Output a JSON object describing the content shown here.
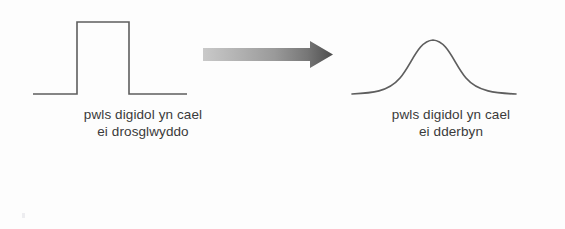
{
  "figure": {
    "name": "digital-pulse-transmission-diagram",
    "background_color": "#fdfdfd",
    "ink_color": "#595959",
    "text_color": "#3a3a3a"
  },
  "left_waveform": {
    "icon": "square-pulse-waveform",
    "description": "square pulse",
    "baseline_y": 94,
    "pulse_top_y": 22,
    "start_x": 33,
    "rise_x": 77,
    "fall_x": 129,
    "end_x": 187,
    "stroke_color": "#5e5e5e",
    "stroke_width": 1.6
  },
  "arrow": {
    "icon": "right-arrow-icon",
    "description": "gradient right arrow",
    "start_x": 203,
    "tip_x": 333,
    "center_y": 54,
    "shaft_thickness": 13,
    "head_height": 28,
    "head_length": 24,
    "gradient_start_color": "#c2c2c2",
    "gradient_end_color": "#4f4f4f"
  },
  "right_waveform": {
    "icon": "bell-curve-waveform",
    "description": "rounded bell-shaped pulse",
    "baseline_y": 94,
    "peak_y": 38,
    "start_x": 352,
    "peak_x": 433,
    "end_x": 516,
    "stroke_color": "#5e5e5e",
    "stroke_width": 1.6
  },
  "captions": {
    "transmitted": {
      "line1": "pwls digidol yn cael",
      "line2": "ei drosglwyddo"
    },
    "received": {
      "line1": "pwls digidol yn cael",
      "line2": "ei dderbyn"
    }
  }
}
